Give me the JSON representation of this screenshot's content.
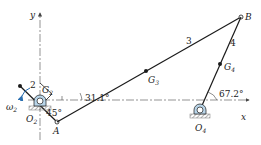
{
  "diagram": {
    "axes": {
      "x_label": "x",
      "y_label": "y"
    },
    "links": [
      {
        "id": "2",
        "label": "2"
      },
      {
        "id": "3",
        "label": "3"
      },
      {
        "id": "4",
        "label": "4"
      }
    ],
    "points": {
      "O2": {
        "label": "O",
        "sub": "2"
      },
      "O4": {
        "label": "O",
        "sub": "4"
      },
      "A": {
        "label": "A"
      },
      "B": {
        "label": "B"
      },
      "G2": {
        "label": "G",
        "sub": "2"
      },
      "G3": {
        "label": "G",
        "sub": "3"
      },
      "G4": {
        "label": "G",
        "sub": "4"
      }
    },
    "angular_velocity": {
      "label": "ω",
      "sub": "2"
    },
    "angles": {
      "link2": "45°",
      "link3": "31.1°",
      "link4": "67.2°"
    },
    "colors": {
      "line": "#1a1a1a",
      "axis": "#555555",
      "pivot_fill": "#b8d4e8",
      "omega_arrow": "#2a6fb0",
      "ground": "#888888"
    }
  }
}
